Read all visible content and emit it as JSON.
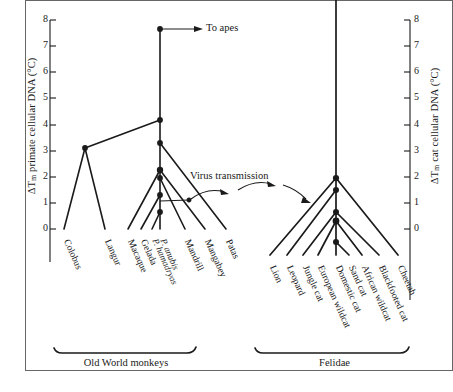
{
  "figure": {
    "left_axis": {
      "label_prefix": "ΔT",
      "label_sub": "m",
      "label_rest": " primate cellular DNA (°C)",
      "ticks": [
        "0",
        "1",
        "2",
        "3",
        "4",
        "5",
        "6",
        "7",
        "8"
      ],
      "range": [
        0,
        8
      ]
    },
    "right_axis": {
      "label_prefix": "ΔT",
      "label_sub": "m",
      "label_rest": " cat cellular DNA (°C)",
      "ticks": [
        "0",
        "1",
        "2",
        "3",
        "4",
        "5",
        "6",
        "7",
        "8"
      ],
      "range": [
        0,
        8
      ]
    },
    "annotations": [
      {
        "name": "to-apes",
        "text": "To apes"
      },
      {
        "name": "virus-transmission",
        "text": "Virus transmission"
      }
    ],
    "groups": [
      {
        "name": "old-world-monkeys",
        "label": "Old World monkeys"
      },
      {
        "name": "felidae",
        "label": "Felidae"
      }
    ],
    "primate_tips": [
      {
        "label": "Colobus",
        "italic": false
      },
      {
        "label": "Langur",
        "italic": false
      },
      {
        "label": "Macaque",
        "italic": false
      },
      {
        "label": "Gelada",
        "italic": false
      },
      {
        "label": "P. hamadryas",
        "italic": true
      },
      {
        "label": "P. anubis",
        "italic": true
      },
      {
        "label": "Mandrill",
        "italic": false
      },
      {
        "label": "Mangabey",
        "italic": false
      },
      {
        "label": "Patas",
        "italic": false
      }
    ],
    "felid_tips": [
      {
        "label": "Lion",
        "italic": false
      },
      {
        "label": "Leopard",
        "italic": false
      },
      {
        "label": "Jungle cat",
        "italic": false
      },
      {
        "label": "European wildcat",
        "italic": false
      },
      {
        "label": "Domestic cat",
        "italic": false
      },
      {
        "label": "Sand cat",
        "italic": false
      },
      {
        "label": "African wildcat",
        "italic": false
      },
      {
        "label": "Blackfooted cat",
        "italic": false
      },
      {
        "label": "Cheetah",
        "italic": false
      }
    ]
  },
  "chart_data": {
    "type": "line",
    "title": "",
    "xlabel": "",
    "ylabel": "ΔTm primate cellular DNA (°C)",
    "ylabel_right": "ΔTm cat cellular DNA (°C)",
    "ylim": [
      0,
      8
    ],
    "ylim_right": [
      0,
      8
    ],
    "grid": false,
    "legend": "none",
    "series": [
      {
        "name": "Old World monkey tree",
        "axis": "left",
        "nodes": [
          {
            "name": "root-to-apes",
            "delta_tm": 7.65
          },
          {
            "name": "colobine-cercopithecine-split",
            "delta_tm": 4.18
          },
          {
            "name": "colobine-node",
            "delta_tm": 3.1
          },
          {
            "name": "cercopithecine-node",
            "delta_tm": 3.3
          },
          {
            "name": "papionin-node",
            "delta_tm": 2.25
          },
          {
            "name": "papio-macaca-node",
            "delta_tm": 1.95
          },
          {
            "name": "papio-gelada-node",
            "delta_tm": 1.3
          },
          {
            "name": "papio-node",
            "delta_tm": 0.65
          }
        ],
        "tips": [
          {
            "name": "Colobus",
            "delta_tm": 0
          },
          {
            "name": "Langur",
            "delta_tm": 0
          },
          {
            "name": "Macaque",
            "delta_tm": 0
          },
          {
            "name": "Gelada",
            "delta_tm": 0
          },
          {
            "name": "P. hamadryas",
            "delta_tm": 0
          },
          {
            "name": "P. anubis",
            "delta_tm": 0
          },
          {
            "name": "Mandrill",
            "delta_tm": 0
          },
          {
            "name": "Mangabey",
            "delta_tm": 0
          },
          {
            "name": "Patas",
            "delta_tm": 0
          }
        ]
      },
      {
        "name": "Felidae tree",
        "axis": "right",
        "nodes": [
          {
            "name": "felidae-root",
            "delta_tm": 2.9
          },
          {
            "name": "pantherine-felis-node",
            "delta_tm": 2.45
          },
          {
            "name": "felis-node",
            "delta_tm": 1.6
          },
          {
            "name": "domestic-cat-clade-node",
            "delta_tm": 1.25
          },
          {
            "name": "domestic-cat-subnode",
            "delta_tm": 0.5
          }
        ],
        "tips": [
          {
            "name": "Lion",
            "delta_tm": 0
          },
          {
            "name": "Leopard",
            "delta_tm": 0
          },
          {
            "name": "Jungle cat",
            "delta_tm": 0
          },
          {
            "name": "European wildcat",
            "delta_tm": 0
          },
          {
            "name": "Domestic cat",
            "delta_tm": 0
          },
          {
            "name": "Sand cat",
            "delta_tm": 0
          },
          {
            "name": "African wildcat",
            "delta_tm": 0
          },
          {
            "name": "Blackfooted cat",
            "delta_tm": 0
          },
          {
            "name": "Cheetah",
            "delta_tm": 0
          }
        ]
      }
    ]
  },
  "colors": {
    "ink": "#1a1a1a",
    "background": "#ffffff",
    "frame": "#555555"
  }
}
